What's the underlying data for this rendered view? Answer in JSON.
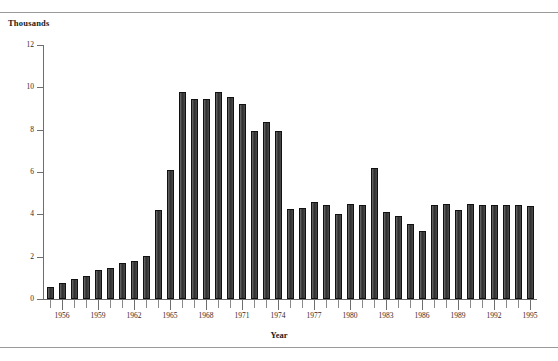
{
  "figure": {
    "y_axis_caption": "Thousands",
    "x_axis_caption": "Year",
    "has_top_rule": true,
    "has_bottom_rule": true,
    "bar_color": "#3a3a3a",
    "axis_color": "#6e6e6e",
    "background": "#ffffff"
  },
  "chart_data": {
    "type": "bar",
    "title": "",
    "subtitle": "",
    "xlabel": "Year",
    "ylabel": "Thousands",
    "ylim": [
      0,
      12
    ],
    "xlim": [
      1954.5,
      1995.5
    ],
    "yticks": [
      0,
      2,
      4,
      6,
      8,
      10,
      12
    ],
    "ytick_labels": [
      "0",
      "2",
      "4",
      "6",
      "8",
      "10",
      "12"
    ],
    "xtick_labels": [
      "1956",
      "1959",
      "1962",
      "1965",
      "1968",
      "1971",
      "1974",
      "1977",
      "1980",
      "1983",
      "1986",
      "1989",
      "1992",
      "1995"
    ],
    "xtick_years": [
      1956,
      1959,
      1962,
      1965,
      1968,
      1971,
      1974,
      1977,
      1980,
      1983,
      1986,
      1989,
      1992,
      1995
    ],
    "grid": false,
    "legend": null,
    "annotations": [],
    "categories": [
      "1955",
      "1956",
      "1957",
      "1958",
      "1959",
      "1960",
      "1961",
      "1962",
      "1963",
      "1964",
      "1965",
      "1966",
      "1967",
      "1968",
      "1969",
      "1970",
      "1971",
      "1972",
      "1973",
      "1974",
      "1975",
      "1976",
      "1977",
      "1978",
      "1979",
      "1980",
      "1981",
      "1982",
      "1983",
      "1984",
      "1985",
      "1986",
      "1987",
      "1988",
      "1989",
      "1990",
      "1991",
      "1992",
      "1993",
      "1994",
      "1995"
    ],
    "values": [
      0.55,
      0.75,
      0.95,
      1.1,
      1.35,
      1.45,
      1.7,
      1.8,
      2.05,
      4.2,
      6.1,
      9.8,
      9.45,
      9.45,
      9.8,
      9.55,
      9.2,
      7.95,
      8.35,
      7.95,
      4.25,
      4.3,
      4.6,
      4.45,
      4.0,
      4.5,
      4.45,
      6.2,
      4.1,
      3.9,
      3.55,
      3.2,
      4.45,
      4.5,
      4.2,
      4.5,
      4.45,
      4.45,
      4.45,
      4.45,
      4.4
    ]
  }
}
